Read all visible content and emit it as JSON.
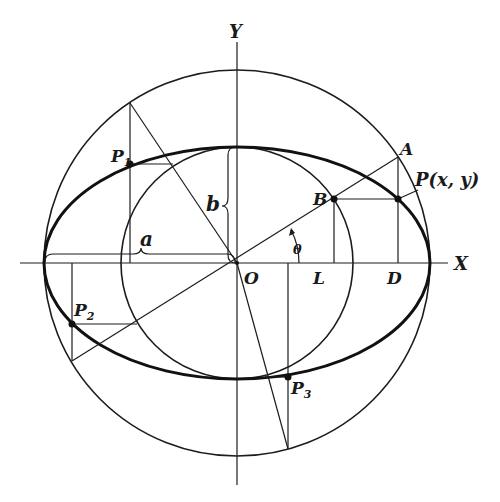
{
  "figure": {
    "colors": {
      "ink": "#1c1c1c",
      "background": "#ffffff"
    },
    "axes": {
      "x_label": "X",
      "y_label": "Y",
      "origin_label": "O"
    },
    "ellipse": {
      "semi_major_label": "a",
      "semi_minor_label": "b"
    },
    "angle_label": "θ",
    "points": {
      "A": "A",
      "B": "B",
      "P": "P(x, y)",
      "L": "L",
      "D": "D",
      "P1": {
        "base": "P",
        "sub": "1"
      },
      "P2": {
        "base": "P",
        "sub": "2"
      },
      "P3": {
        "base": "P",
        "sub": "3"
      }
    }
  }
}
